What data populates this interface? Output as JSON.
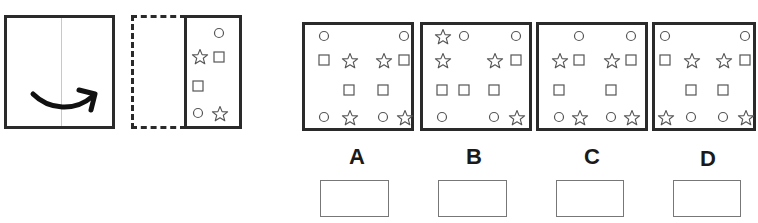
{
  "puzzle": {
    "type": "paper-folding",
    "fold_direction": "left-over-right",
    "folded_panel_symbols": [
      {
        "shape": "circle",
        "x": 219,
        "y": 33
      },
      {
        "shape": "star",
        "x": 199,
        "y": 56
      },
      {
        "shape": "square",
        "x": 219,
        "y": 57
      },
      {
        "shape": "square",
        "x": 198,
        "y": 86
      },
      {
        "shape": "circle",
        "x": 198,
        "y": 113
      },
      {
        "shape": "star",
        "x": 219,
        "y": 113
      }
    ],
    "options": [
      {
        "label": "A",
        "left": 302,
        "symbols": [
          {
            "shape": "circle",
            "x": 19,
            "y": 11
          },
          {
            "shape": "circle",
            "x": 99,
            "y": 11
          },
          {
            "shape": "square",
            "x": 19,
            "y": 35
          },
          {
            "shape": "star",
            "x": 44,
            "y": 35
          },
          {
            "shape": "star",
            "x": 78,
            "y": 35
          },
          {
            "shape": "square",
            "x": 99,
            "y": 35
          },
          {
            "shape": "square",
            "x": 44,
            "y": 65
          },
          {
            "shape": "square",
            "x": 78,
            "y": 65
          },
          {
            "shape": "circle",
            "x": 19,
            "y": 92
          },
          {
            "shape": "star",
            "x": 44,
            "y": 92
          },
          {
            "shape": "circle",
            "x": 78,
            "y": 92
          },
          {
            "shape": "star",
            "x": 99,
            "y": 92
          }
        ]
      },
      {
        "label": "B",
        "left": 420,
        "symbols": [
          {
            "shape": "star",
            "x": 19,
            "y": 11
          },
          {
            "shape": "circle",
            "x": 41,
            "y": 11
          },
          {
            "shape": "circle",
            "x": 93,
            "y": 11
          },
          {
            "shape": "star",
            "x": 19,
            "y": 35
          },
          {
            "shape": "star",
            "x": 71,
            "y": 35
          },
          {
            "shape": "square",
            "x": 93,
            "y": 35
          },
          {
            "shape": "square",
            "x": 19,
            "y": 65
          },
          {
            "shape": "square",
            "x": 41,
            "y": 65
          },
          {
            "shape": "square",
            "x": 71,
            "y": 65
          },
          {
            "shape": "circle",
            "x": 19,
            "y": 92
          },
          {
            "shape": "circle",
            "x": 71,
            "y": 92
          },
          {
            "shape": "star",
            "x": 93,
            "y": 92
          }
        ]
      },
      {
        "label": "C",
        "left": 536,
        "symbols": [
          {
            "shape": "circle",
            "x": 40,
            "y": 11
          },
          {
            "shape": "circle",
            "x": 92,
            "y": 11
          },
          {
            "shape": "star",
            "x": 20,
            "y": 35
          },
          {
            "shape": "square",
            "x": 40,
            "y": 35
          },
          {
            "shape": "star",
            "x": 72,
            "y": 35
          },
          {
            "shape": "square",
            "x": 92,
            "y": 35
          },
          {
            "shape": "square",
            "x": 20,
            "y": 65
          },
          {
            "shape": "square",
            "x": 72,
            "y": 65
          },
          {
            "shape": "circle",
            "x": 20,
            "y": 92
          },
          {
            "shape": "star",
            "x": 40,
            "y": 92
          },
          {
            "shape": "circle",
            "x": 72,
            "y": 92
          },
          {
            "shape": "star",
            "x": 92,
            "y": 92
          }
        ]
      },
      {
        "label": "D",
        "left": 652,
        "symbols": [
          {
            "shape": "circle",
            "x": 10,
            "y": 11
          },
          {
            "shape": "circle",
            "x": 90,
            "y": 11
          },
          {
            "shape": "square",
            "x": 10,
            "y": 35
          },
          {
            "shape": "star",
            "x": 36,
            "y": 35
          },
          {
            "shape": "star",
            "x": 68,
            "y": 35
          },
          {
            "shape": "square",
            "x": 90,
            "y": 35
          },
          {
            "shape": "square",
            "x": 36,
            "y": 65
          },
          {
            "shape": "square",
            "x": 68,
            "y": 65
          },
          {
            "shape": "star",
            "x": 10,
            "y": 92
          },
          {
            "shape": "circle",
            "x": 36,
            "y": 92
          },
          {
            "shape": "circle",
            "x": 68,
            "y": 92
          },
          {
            "shape": "star",
            "x": 90,
            "y": 92
          }
        ]
      }
    ]
  },
  "labels": {
    "a": "A",
    "b": "B",
    "c": "C",
    "d": "D"
  },
  "icons": {
    "fold_arrow": "curved-arrow-right-icon",
    "circle": "circle-icon",
    "square": "square-icon",
    "star": "star-icon"
  },
  "colors": {
    "stroke": "#2a2a2a",
    "symbol": "#555555",
    "answer_box": "#777777"
  }
}
